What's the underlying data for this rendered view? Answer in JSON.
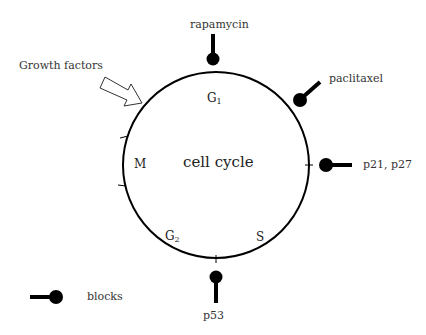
{
  "diagram": {
    "title": "cell cycle",
    "phases": [
      {
        "name": "G",
        "sub": "1"
      },
      {
        "name": "S",
        "sub": ""
      },
      {
        "name": "G",
        "sub": "2"
      },
      {
        "name": "M",
        "sub": ""
      }
    ],
    "input": {
      "label": "Growth factors",
      "icon": "hollow-arrow-icon"
    },
    "inhibitors": [
      {
        "label": "rapamycin"
      },
      {
        "label": "paclitaxel"
      },
      {
        "label": "p21, p27"
      },
      {
        "label": "p53"
      }
    ],
    "legend": {
      "label": "blocks",
      "icon": "block-symbol-icon"
    },
    "colors": {
      "line": "#000000",
      "text": "#222222",
      "background": "#ffffff"
    }
  }
}
